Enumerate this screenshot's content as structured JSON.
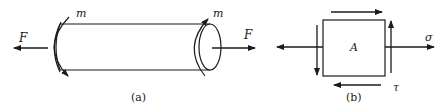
{
  "figure_a": {
    "caption": "(a)",
    "force_left_label": "F",
    "force_right_label": "F",
    "moment_left_label": "m",
    "moment_right_label": "m",
    "description": "Cylindrical bar under axial tension F and torque m"
  },
  "figure_b": {
    "caption": "(b)",
    "element_label": "A",
    "normal_stress_label": "σ",
    "shear_stress_label": "τ",
    "description": "Stress element A under normal stress σ and shear stress τ"
  },
  "colors": {
    "stroke": "#1a1a1a",
    "background": "#ffffff"
  }
}
